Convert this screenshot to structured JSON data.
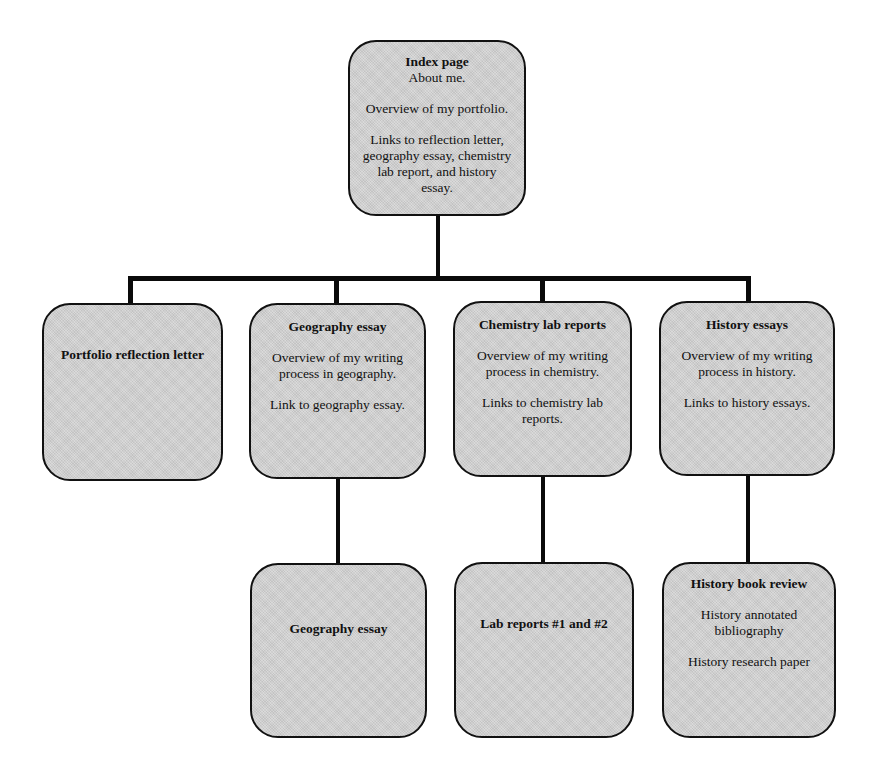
{
  "diagram": {
    "type": "hierarchy",
    "root": {
      "id": "index-page",
      "title": "Index page",
      "lines": [
        "About me.",
        "Overview of my portfolio.",
        "Links to reflection letter, geography essay, chemistry lab report, and history essay."
      ]
    },
    "level1": [
      {
        "id": "portfolio-reflection-letter",
        "title": "Portfolio reflection letter",
        "lines": []
      },
      {
        "id": "geography-essay",
        "title": "Geography essay",
        "lines": [
          "Overview of my writing process in geography.",
          "Link to geography essay."
        ]
      },
      {
        "id": "chemistry-lab-reports",
        "title": "Chemistry lab reports",
        "lines": [
          "Overview of my writing process in chemistry.",
          "Links to chemistry lab reports."
        ]
      },
      {
        "id": "history-essays",
        "title": "History essays",
        "lines": [
          "Overview of my writing process in history.",
          "Links to history essays."
        ]
      }
    ],
    "level2": [
      {
        "id": "geography-essay-page",
        "parent": "geography-essay",
        "title": "Geography essay",
        "lines": []
      },
      {
        "id": "lab-reports-page",
        "parent": "chemistry-lab-reports",
        "title": "Lab reports #1 and #2",
        "lines": []
      },
      {
        "id": "history-works-page",
        "parent": "history-essays",
        "title": "History book review",
        "lines": [
          "History annotated bibliography",
          "History research paper"
        ]
      }
    ],
    "colors": {
      "box_fill": "#d2d2d2",
      "box_border": "#111111",
      "connector": "#0a0a0a",
      "background": "#ffffff"
    }
  }
}
